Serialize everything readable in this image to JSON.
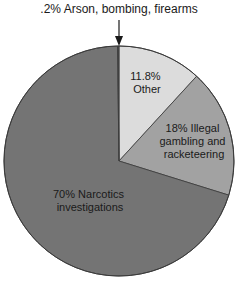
{
  "chart_data": {
    "type": "pie",
    "title": "",
    "start_angle_deg": 0,
    "direction": "clockwise",
    "slices": [
      {
        "label": "Arson, bombing, firearms",
        "value": 0.2,
        "color": "#4a4a4a",
        "display": ".2% Arson, bombing, firearms",
        "callout": true
      },
      {
        "label": "Other",
        "value": 11.8,
        "color": "#dcdcdc",
        "display_lines": [
          "11.8%",
          "Other"
        ]
      },
      {
        "label": "Illegal gambling and racketeering",
        "value": 18,
        "color": "#a2a2a2",
        "display_lines": [
          "18% Illegal",
          "gambling and",
          "racketeering"
        ]
      },
      {
        "label": "Narcotics investigations",
        "value": 70,
        "color": "#747474",
        "display_lines": [
          "70% Narcotics",
          "investigations"
        ]
      }
    ],
    "categories": [
      "Arson, bombing, firearms",
      "Other",
      "Illegal gambling and racketeering",
      "Narcotics investigations"
    ],
    "values": [
      0.2,
      11.8,
      18,
      70
    ],
    "units": "%"
  },
  "annotation": {
    "text": ".2% Arson, bombing, firearms"
  },
  "labels": {
    "other": [
      "11.8%",
      "Other"
    ],
    "gambling": [
      "18% Illegal",
      "gambling and",
      "racketeering"
    ],
    "narcotics": [
      "70% Narcotics",
      "investigations"
    ]
  }
}
